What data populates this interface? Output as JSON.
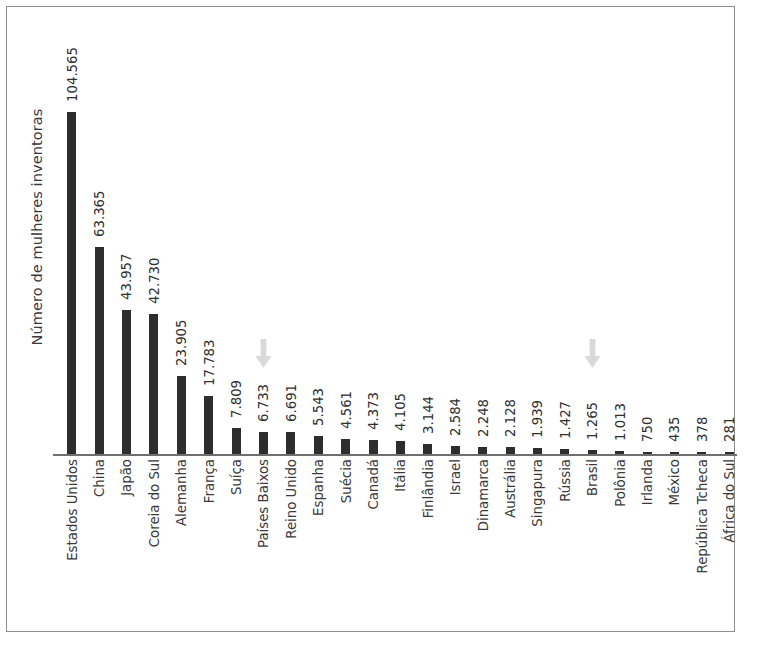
{
  "chart_data": {
    "type": "bar",
    "title": "",
    "xlabel": "",
    "ylabel": "Número de mulheres inventoras",
    "ylim": [
      0,
      104565
    ],
    "grid": false,
    "legend": null,
    "orientation": "vertical",
    "value_label_format": "pt-BR thousands separator (.)",
    "categories": [
      "Estados Unidos",
      "China",
      "Japão",
      "Coreia do Sul",
      "Alemanha",
      "França",
      "Suíça",
      "Países Baixos",
      "Reino Unido",
      "Espanha",
      "Suécia",
      "Canadá",
      "Itália",
      "Finlândia",
      "Israel",
      "Dinamarca",
      "Austrália",
      "Singapura",
      "Rússia",
      "Brasil",
      "Polônia",
      "Irlanda",
      "México",
      "República Tcheca",
      "África do Sul"
    ],
    "values": [
      104565,
      63365,
      43957,
      42730,
      23905,
      17783,
      7809,
      6733,
      6691,
      5543,
      4561,
      4373,
      4105,
      3144,
      2584,
      2248,
      2128,
      1939,
      1427,
      1265,
      1013,
      750,
      435,
      378,
      281
    ],
    "value_labels": [
      "104.565",
      "63.365",
      "43.957",
      "42.730",
      "23.905",
      "17.783",
      "7.809",
      "6.733",
      "6.691",
      "5.543",
      "4.561",
      "4.373",
      "4.105",
      "3.144",
      "2.584",
      "2.248",
      "2.128",
      "1.939",
      "1.427",
      "1.265",
      "1.013",
      "750",
      "435",
      "378",
      "281"
    ],
    "annotations": [
      {
        "kind": "down-arrow",
        "target_category": "Países Baixos",
        "color": "#d9d9d9"
      },
      {
        "kind": "down-arrow",
        "target_category": "Brasil",
        "color": "#d9d9d9"
      }
    ],
    "colors": {
      "bar": "#2d2d2d",
      "axis": "#6f6f6f",
      "text": "#3a3a3a",
      "arrow": "#d9d9d9",
      "frame": "#8f8f8f",
      "background": "#ffffff"
    }
  }
}
